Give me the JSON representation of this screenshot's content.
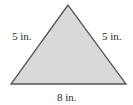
{
  "figure": {
    "shape": "isosceles-triangle",
    "fill_color": "#d9d9d9",
    "stroke_color": "#555555",
    "vertices": {
      "apex": [
        68,
        5
      ],
      "bottom_left": [
        11,
        84
      ],
      "bottom_right": [
        126,
        84
      ]
    },
    "labels": {
      "left_side": "5 in.",
      "right_side": "5 in.",
      "base": "8 in."
    }
  }
}
